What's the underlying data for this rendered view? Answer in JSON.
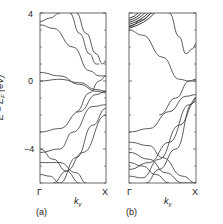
{
  "chart_data": [
    {
      "type": "line",
      "panel": "(a)",
      "title": "",
      "xlabel": "k_y",
      "ylabel": "E − E_F (eV)",
      "x_ticks": [
        "Γ",
        "X"
      ],
      "y_ticks": [
        4,
        0,
        -4
      ],
      "ylim": [
        -6,
        4
      ],
      "xlim": [
        0,
        1
      ],
      "grid": false,
      "series": [
        {
          "name": "band1",
          "x": [
            0,
            0.15,
            0.3
          ],
          "y": [
            3.5,
            3.7,
            4.0
          ]
        },
        {
          "name": "band2",
          "x": [
            0,
            0.2,
            0.5,
            0.75,
            0.9,
            1.0
          ],
          "y": [
            3.3,
            3.1,
            2.0,
            0.6,
            0.3,
            0.3
          ]
        },
        {
          "name": "band3",
          "x": [
            0.45,
            0.6,
            0.75,
            0.85,
            0.9
          ],
          "y": [
            4.0,
            2.8,
            1.6,
            1.0,
            1.0
          ]
        },
        {
          "name": "band4",
          "x": [
            0.55,
            0.7,
            0.85,
            0.95,
            1.0
          ],
          "y": [
            4.0,
            2.8,
            1.6,
            1.0,
            1.2
          ]
        },
        {
          "name": "band5",
          "x": [
            0,
            0.3,
            0.6,
            0.85,
            1.0
          ],
          "y": [
            0.5,
            0.3,
            -0.2,
            -0.6,
            -0.7
          ]
        },
        {
          "name": "band6",
          "x": [
            0,
            0.3,
            0.6,
            0.85,
            1.0
          ],
          "y": [
            0.0,
            0.1,
            -0.1,
            -0.5,
            -0.6
          ]
        },
        {
          "name": "band7",
          "x": [
            0.55,
            0.75,
            0.9,
            1.0
          ],
          "y": [
            -1.8,
            -0.7,
            0.0,
            0.3
          ]
        },
        {
          "name": "band8",
          "x": [
            0.3,
            0.55,
            0.8,
            1.0
          ],
          "y": [
            -6.0,
            -4.5,
            -2.6,
            -1.6
          ]
        },
        {
          "name": "band9",
          "x": [
            0,
            0.3,
            0.6,
            0.85,
            1.0
          ],
          "y": [
            -3.0,
            -2.8,
            -1.8,
            -0.8,
            -0.6
          ]
        },
        {
          "name": "band10",
          "x": [
            0,
            0.3,
            0.5,
            0.8,
            1.0
          ],
          "y": [
            -4.2,
            -4.0,
            -3.0,
            -1.5,
            -1.4
          ]
        },
        {
          "name": "band11",
          "x": [
            0,
            0.2,
            0.4,
            0.6
          ],
          "y": [
            -4.0,
            -4.6,
            -5.3,
            -6.0
          ]
        },
        {
          "name": "band12",
          "x": [
            0,
            0.3,
            0.55,
            0.7
          ],
          "y": [
            -4.8,
            -4.8,
            -5.4,
            -6.0
          ]
        },
        {
          "name": "band13",
          "x": [
            0,
            0.15,
            0.3
          ],
          "y": [
            -5.5,
            -5.6,
            -6.0
          ]
        },
        {
          "name": "band14",
          "x": [
            0.2,
            0.4,
            0.65,
            1.0
          ],
          "y": [
            -6.0,
            -5.3,
            -4.2,
            -2.0
          ]
        }
      ]
    },
    {
      "type": "line",
      "panel": "(b)",
      "title": "",
      "xlabel": "k_y",
      "ylabel": "E − E_F (eV)",
      "x_ticks": [
        "Γ",
        "X"
      ],
      "y_ticks": [
        4,
        0,
        -4
      ],
      "ylim": [
        -6,
        4
      ],
      "xlim": [
        0,
        1
      ],
      "grid": false,
      "series": [
        {
          "name": "band_cluster_top",
          "x": [
            0,
            0.2,
            0.35
          ],
          "y": [
            3.2,
            3.6,
            4.0
          ]
        },
        {
          "name": "band2",
          "x": [
            0,
            0.2,
            0.5,
            0.75,
            0.9,
            1.0
          ],
          "y": [
            3.0,
            2.7,
            1.4,
            0.1,
            0.0,
            0.0
          ]
        },
        {
          "name": "band3",
          "x": [
            0.6,
            0.75,
            0.85,
            0.95,
            1.0
          ],
          "y": [
            4.0,
            2.6,
            1.6,
            1.9,
            2.2
          ]
        },
        {
          "name": "band4",
          "x": [
            0.45,
            0.7,
            0.9,
            1.0
          ],
          "y": [
            -2.0,
            -1.0,
            0.0,
            0.1
          ]
        },
        {
          "name": "band5",
          "x": [
            0,
            0.3,
            0.6,
            0.85,
            1.0
          ],
          "y": [
            -3.0,
            -2.8,
            -1.8,
            -0.9,
            -0.8
          ]
        },
        {
          "name": "band6",
          "x": [
            0,
            0.3,
            0.5,
            0.8,
            1.0
          ],
          "y": [
            -3.6,
            -3.8,
            -4.5,
            -5.6,
            -6.0
          ]
        },
        {
          "name": "band7",
          "x": [
            0,
            0.3,
            0.55,
            0.8,
            0.95
          ],
          "y": [
            -4.2,
            -4.6,
            -5.4,
            -6.0,
            -6.0
          ]
        },
        {
          "name": "band8",
          "x": [
            0,
            0.2,
            0.4,
            0.6
          ],
          "y": [
            -4.8,
            -5.0,
            -5.5,
            -6.0
          ]
        },
        {
          "name": "band9",
          "x": [
            0,
            0.3,
            0.6,
            0.9,
            1.0
          ],
          "y": [
            -5.2,
            -4.8,
            -3.6,
            -1.4,
            -1.0
          ]
        },
        {
          "name": "band10",
          "x": [
            0,
            0.2,
            0.45,
            0.75,
            1.0
          ],
          "y": [
            -5.6,
            -5.7,
            -4.6,
            -2.6,
            -1.2
          ]
        },
        {
          "name": "band11",
          "x": [
            0.25,
            0.45,
            0.7,
            0.95,
            1.0
          ],
          "y": [
            -6.0,
            -5.2,
            -4.0,
            -1.3,
            -1.0
          ]
        }
      ]
    }
  ],
  "axis": {
    "ylabel_main": "E − E",
    "ylabel_sub": "F",
    "ylabel_unit": " (eV)",
    "tick_4": "4",
    "tick_0": "0",
    "tick_m4": "−4"
  },
  "panels": {
    "a": {
      "label": "(a)",
      "gamma": "Γ",
      "x": "X",
      "k": "k",
      "k_sub": "y"
    },
    "b": {
      "label": "(b)",
      "gamma": "Γ",
      "x": "X",
      "k": "k",
      "k_sub": "y"
    }
  }
}
